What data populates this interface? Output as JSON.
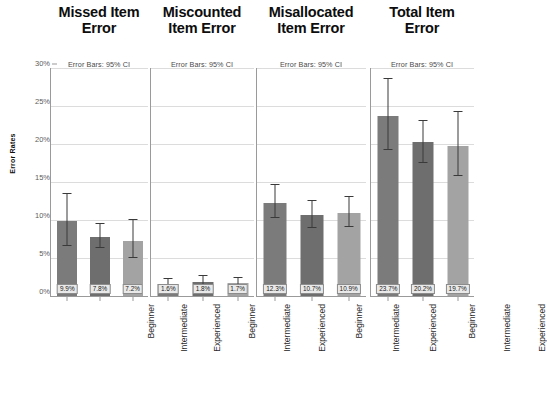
{
  "chart_data": {
    "type": "bar",
    "title": "",
    "xlabel": "",
    "ylabel": "Error Rates",
    "ylim": [
      0,
      30
    ],
    "grid": true,
    "legend": "none",
    "ytick_labels": [
      "0%",
      "5%",
      "10%",
      "15%",
      "20%",
      "25%",
      "30%"
    ],
    "ytick_values": [
      0,
      5,
      10,
      15,
      20,
      25,
      30
    ],
    "categories": [
      "Beginner",
      "Intermediate",
      "Experienced"
    ],
    "error_bar_note": "Error Bars: 95% CI",
    "panels": [
      {
        "title_line1": "Missed Item",
        "title_line2": "Error",
        "subtitle": "Error Bars: 95% CI",
        "values": [
          9.9,
          7.8,
          7.2
        ],
        "labels": [
          "9.9%",
          "7.8%",
          "7.2%"
        ],
        "ci_low": [
          6.6,
          6.3,
          5.0
        ],
        "ci_high": [
          13.4,
          9.5,
          10.0
        ]
      },
      {
        "title_line1": "Miscounted",
        "title_line2": "Item Error",
        "subtitle": "Error Bars: 95% CI",
        "values": [
          1.6,
          1.8,
          1.7
        ],
        "labels": [
          "1.6%",
          "1.8%",
          "1.7%"
        ],
        "ci_low": [
          1.0,
          1.1,
          1.1
        ],
        "ci_high": [
          2.3,
          2.6,
          2.4
        ]
      },
      {
        "title_line1": "Misallocated",
        "title_line2": "Item Error",
        "subtitle": "Error Bars: 95% CI",
        "values": [
          12.3,
          10.7,
          10.9
        ],
        "labels": [
          "12.3%",
          "10.7%",
          "10.9%"
        ],
        "ci_low": [
          10.2,
          9.0,
          9.1
        ],
        "ci_high": [
          14.6,
          12.5,
          13.0
        ]
      },
      {
        "title_line1": "Total Item",
        "title_line2": "Error",
        "subtitle": "Error Bars: 95% CI",
        "values": [
          23.7,
          20.2,
          19.7
        ],
        "labels": [
          "23.7%",
          "20.2%",
          "19.7%"
        ],
        "ci_low": [
          19.2,
          17.5,
          15.8
        ],
        "ci_high": [
          28.6,
          23.0,
          24.2
        ]
      }
    ],
    "colors": {
      "bar_beginner": "#7b7b7b",
      "bar_intermediate": "#6e6e6e",
      "bar_experienced": "#a3a3a3",
      "error_bar": "#3a3a3a",
      "gridline": "#dcdcdc",
      "axis": "#9a9a9a",
      "label_fill": "#e9e9e9"
    }
  }
}
